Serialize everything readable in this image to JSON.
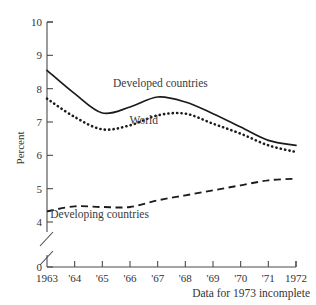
{
  "chart_data": {
    "type": "line",
    "title": "",
    "xlabel": "",
    "ylabel": "Percent",
    "caption": "Data for 1973 incomplete",
    "x": [
      1963,
      1964,
      1965,
      1966,
      1967,
      1968,
      1969,
      1970,
      1971,
      1972
    ],
    "categories": [
      "1963",
      "'64",
      "'65",
      "'66",
      "'67",
      "'68",
      "'69",
      "'70",
      "'71",
      "1972"
    ],
    "ylim": [
      4,
      10
    ],
    "y_break": {
      "from": 0,
      "to": 4,
      "present": true
    },
    "yticks": [
      0,
      4,
      5,
      6,
      7,
      8,
      9,
      10
    ],
    "ytick_labels": [
      "0",
      "4",
      "5",
      "6",
      "7",
      "8",
      "9",
      "10"
    ],
    "grid": false,
    "legend": "inline-annotations",
    "series": [
      {
        "name": "Developed countries",
        "style": "solid",
        "label_x": 1967.1,
        "label_y": 8.05,
        "values": [
          8.55,
          7.85,
          7.27,
          7.45,
          7.75,
          7.6,
          7.25,
          6.85,
          6.45,
          6.3
        ]
      },
      {
        "name": "World",
        "style": "dotted",
        "label_x": 1966.5,
        "label_y": 6.95,
        "values": [
          7.7,
          7.15,
          6.78,
          6.9,
          7.2,
          7.25,
          6.95,
          6.65,
          6.3,
          6.1
        ]
      },
      {
        "name": "Developing countries",
        "style": "dashed",
        "label_x": 1964.9,
        "label_y": 4.12,
        "values": [
          4.32,
          4.47,
          4.45,
          4.45,
          4.65,
          4.8,
          4.95,
          5.1,
          5.25,
          5.3
        ]
      }
    ]
  }
}
